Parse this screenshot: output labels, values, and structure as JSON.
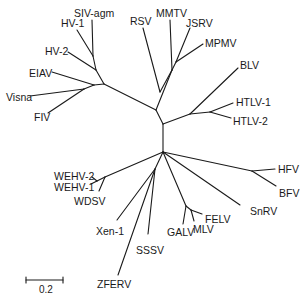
{
  "diagram": {
    "type": "unrooted phylogenetic tree",
    "line_color": "#1a1a1a",
    "background": "#ffffff"
  },
  "labels": {
    "siv_agm": "SIV-agm",
    "hv1": "HV-1",
    "hv2": "HV-2",
    "eiav": "EIAV",
    "visna": "Visna",
    "fiv": "FIV",
    "rsv": "RSV",
    "mmtv": "MMTV",
    "jsrv": "JSRV",
    "mpmv": "MPMV",
    "blv": "BLV",
    "htlv1": "HTLV-1",
    "htlv2": "HTLV-2",
    "hfv": "HFV",
    "bfv": "BFV",
    "snrv": "SnRV",
    "felv": "FELV",
    "mlv": "MLV",
    "galv": "GALV",
    "sssv": "SSSV",
    "zferv": "ZFERV",
    "xen1": "Xen-1",
    "wehv2": "WEHV-2",
    "wehv1": "WEHV-1",
    "wdsv": "WDSV"
  },
  "scale_bar": {
    "label": "0.2"
  }
}
